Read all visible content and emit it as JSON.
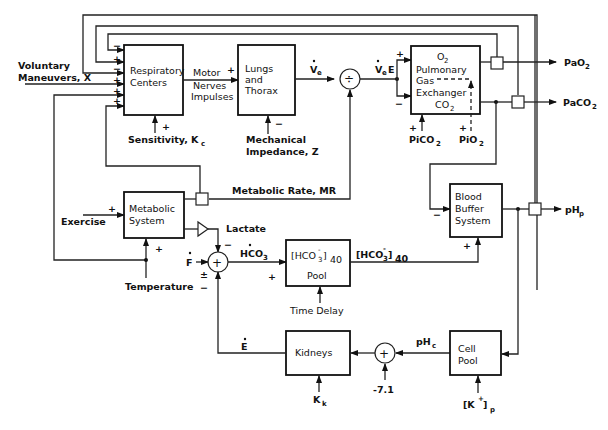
{
  "diagram": {
    "type": "block-diagram",
    "blocks": {
      "respiratory_centers": {
        "line1": "Respiratory",
        "line2": "Centers"
      },
      "lungs_thorax": {
        "line1": "Lungs",
        "line2": "and",
        "line3": "Thorax"
      },
      "gas_exchanger": {
        "o2": "O",
        "o2_sub": "2",
        "line1": "Pulmonary",
        "line2": "Gas",
        "line3": "Exchanger",
        "co2": "CO",
        "co2_sub": "2"
      },
      "metabolic_system": {
        "line1": "Metabolic",
        "line2": "System"
      },
      "hco3_pool": {
        "bracket": "[HCO",
        "sub": "3",
        "sup": "-",
        "close": "]",
        "subscript": "40",
        "label": "Pool"
      },
      "blood_buffer": {
        "line1": "Blood",
        "line2": "Buffer",
        "line3": "System"
      },
      "kidneys": {
        "label": "Kidneys"
      },
      "cell_pool": {
        "line1": "Cell",
        "line2": "Pool"
      }
    },
    "inputs": {
      "voluntary_line1": "Voluntary",
      "voluntary_line2": "Maneuvers, X",
      "sensitivity": "Sensitivity, K",
      "sensitivity_sub": "c",
      "mech_line1": "Mechanical",
      "mech_line2": "Impedance, Z",
      "picO2_pre": "PiCO",
      "picO2_sub": "2",
      "piO2_pre": "PiO",
      "piO2_sub": "2",
      "exercise": "Exercise",
      "temperature": "Temperature",
      "time_delay": "Time Delay",
      "kk": "K",
      "kk_sub": "k",
      "kp_open": "[K",
      "kp_sup": "+",
      "kp_close": "]",
      "kp_sub": "p",
      "minus71": "-7.1",
      "f_dot": "F"
    },
    "signals": {
      "motor_line1": "Motor",
      "motor_line2": "Nerves",
      "motor_line3": "Impulses",
      "ve": "V",
      "ve_sub": "e",
      "vee": "V",
      "vee_sub": "e",
      "vee_suffix": "E",
      "metabolic_rate": "Metabolic  Rate, MR",
      "lactate": "Lactate",
      "hco3_dot": "HCO",
      "hco3_dot_sub": "3",
      "hco3_out": "[HCO",
      "hco3_out_sub": "3",
      "hco3_out_sup": "-",
      "hco3_out_close": "]",
      "hco3_out_40": "40",
      "e_dot": "E",
      "phc": "pH",
      "phc_sub": "c"
    },
    "outputs": {
      "pao2": "PaO",
      "pao2_sub": "2",
      "paco2": "PaCO",
      "paco2_sub": "2",
      "php": "pH",
      "php_sub": "p"
    },
    "signs": {
      "plus": "+",
      "minus": "−",
      "plus_minus": "±",
      "divide": "÷"
    },
    "colors": {
      "line": "#222222",
      "background": "#ffffff"
    }
  }
}
